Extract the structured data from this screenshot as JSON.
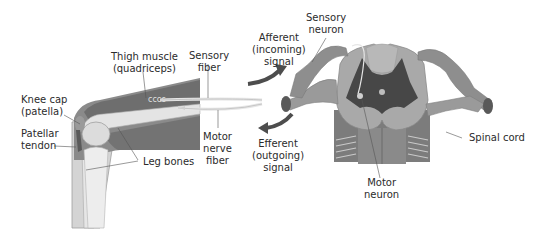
{
  "diagram": {
    "colors": {
      "background": "#ffffff",
      "muscle_dark": "#6a6a6a",
      "muscle_mid": "#8c8c8c",
      "bone": "#d9d9d9",
      "skin": "#bdbdbd",
      "grey_matter": "#4a4a4a",
      "white_matter": "#a8a8a8",
      "nerve": "#9a9a9a",
      "arrow": "#4d4d4d",
      "text": "#2b2b2b"
    },
    "labels": {
      "thigh_muscle": {
        "line1": "Thigh muscle",
        "line2": "(quadriceps)"
      },
      "sensory_fiber": {
        "line1": "Sensory",
        "line2": "fiber"
      },
      "knee_cap": {
        "line1": "Knee cap",
        "line2": "(patella)"
      },
      "patellar_tendon": {
        "line1": "Patellar",
        "line2": "tendon"
      },
      "leg_bones": {
        "line1": "Leg bones"
      },
      "motor_nerve_fiber": {
        "line1": "Motor",
        "line2": "nerve",
        "line3": "fiber"
      },
      "afferent": {
        "line1": "Afferent",
        "line2": "(incoming)",
        "line3": "signal"
      },
      "efferent": {
        "line1": "Efferent",
        "line2": "(outgoing)",
        "line3": "signal"
      },
      "sensory_neuron": {
        "line1": "Sensory",
        "line2": "neuron"
      },
      "motor_neuron": {
        "line1": "Motor",
        "line2": "neuron"
      },
      "spinal_cord": {
        "line1": "Spinal cord"
      }
    }
  }
}
